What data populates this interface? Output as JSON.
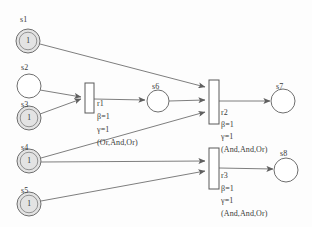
{
  "diagram": {
    "type": "petri-net",
    "canvas": {
      "width": 312,
      "height": 227
    },
    "colors": {
      "stroke": "#6f6f6f",
      "marked_fill": "#e3e3e3",
      "empty_fill": "#ffffff",
      "text": "#3a3a3a",
      "transition_fill": "#ffffff",
      "transition_stroke": "#5a5a5a"
    },
    "places": [
      {
        "id": "s1",
        "label": "s1",
        "tokens": "1",
        "marked": true,
        "cx": 28,
        "cy": 41,
        "r": 12,
        "label_x": 20,
        "label_y": 16
      },
      {
        "id": "s2",
        "label": "s2",
        "tokens": "",
        "marked": false,
        "cx": 29,
        "cy": 86,
        "r": 12,
        "label_x": 21,
        "label_y": 64
      },
      {
        "id": "s3",
        "label": "s3",
        "tokens": "1",
        "marked": true,
        "cx": 29,
        "cy": 118,
        "r": 12,
        "label_x": 21,
        "label_y": 101
      },
      {
        "id": "s4",
        "label": "s4",
        "tokens": "1",
        "marked": true,
        "cx": 29,
        "cy": 161,
        "r": 12,
        "label_x": 21,
        "label_y": 144
      },
      {
        "id": "s5",
        "label": "s5",
        "tokens": "1",
        "marked": true,
        "cx": 29,
        "cy": 204,
        "r": 12,
        "label_x": 21,
        "label_y": 187
      },
      {
        "id": "s6",
        "label": "s6",
        "tokens": "",
        "marked": false,
        "cx": 158,
        "cy": 101,
        "r": 11,
        "label_x": 152,
        "label_y": 83
      },
      {
        "id": "s7",
        "label": "s7",
        "tokens": "",
        "marked": false,
        "cx": 283,
        "cy": 101,
        "r": 12,
        "label_x": 276,
        "label_y": 83
      },
      {
        "id": "s8",
        "label": "s8",
        "tokens": "",
        "marked": false,
        "cx": 286,
        "cy": 170,
        "r": 12,
        "label_x": 280,
        "label_y": 150
      }
    ],
    "transitions": [
      {
        "id": "r1",
        "name": "r1",
        "beta": "β=1",
        "gamma": "γ=1",
        "semantics": "(Or,And,Or)",
        "x": 85,
        "y": 83,
        "w": 9,
        "h": 30,
        "label_x": 97,
        "name_y": 100,
        "beta_y": 113,
        "gamma_y": 126,
        "sem_y": 139
      },
      {
        "id": "r2",
        "name": "r2",
        "beta": "β=1",
        "gamma": "γ=1",
        "semantics": "(And,And,Or)",
        "x": 209,
        "y": 80,
        "w": 10,
        "h": 44,
        "label_x": 221,
        "name_y": 109,
        "beta_y": 121,
        "gamma_y": 133,
        "sem_y": 146
      },
      {
        "id": "r3",
        "name": "r3",
        "beta": "β=1",
        "gamma": "γ=1",
        "semantics": "(And,And,Or)",
        "x": 209,
        "y": 148,
        "w": 10,
        "h": 41,
        "label_x": 221,
        "name_y": 172,
        "beta_y": 185,
        "gamma_y": 197,
        "sem_y": 210
      }
    ],
    "arcs": [
      {
        "id": "arc-s1-r2",
        "from": "s1",
        "to": "r2",
        "x1": 40,
        "y1": 44,
        "x2": 205,
        "y2": 87
      },
      {
        "id": "arc-s2-r1",
        "from": "s2",
        "to": "r1",
        "x1": 40,
        "y1": 90,
        "x2": 81,
        "y2": 97
      },
      {
        "id": "arc-s3-r1",
        "from": "s3",
        "to": "r1",
        "x1": 40,
        "y1": 114,
        "x2": 81,
        "y2": 99
      },
      {
        "id": "arc-r1-s6",
        "from": "r1",
        "to": "s6",
        "x1": 94,
        "y1": 99,
        "x2": 145,
        "y2": 100
      },
      {
        "id": "arc-s6-r2",
        "from": "s6",
        "to": "r2",
        "x1": 169,
        "y1": 101,
        "x2": 205,
        "y2": 100
      },
      {
        "id": "arc-s4-r2",
        "from": "s4",
        "to": "r2",
        "x1": 41,
        "y1": 158,
        "x2": 205,
        "y2": 112
      },
      {
        "id": "arc-r2-s7",
        "from": "r2",
        "to": "s7",
        "x1": 219,
        "y1": 101,
        "x2": 270,
        "y2": 101
      },
      {
        "id": "arc-s4-r3",
        "from": "s4",
        "to": "r3",
        "x1": 41,
        "y1": 162,
        "x2": 205,
        "y2": 161
      },
      {
        "id": "arc-s5-r3",
        "from": "s5",
        "to": "r3",
        "x1": 41,
        "y1": 201,
        "x2": 205,
        "y2": 171
      },
      {
        "id": "arc-r3-s8",
        "from": "r3",
        "to": "s8",
        "x1": 219,
        "y1": 168,
        "x2": 273,
        "y2": 169
      }
    ]
  }
}
